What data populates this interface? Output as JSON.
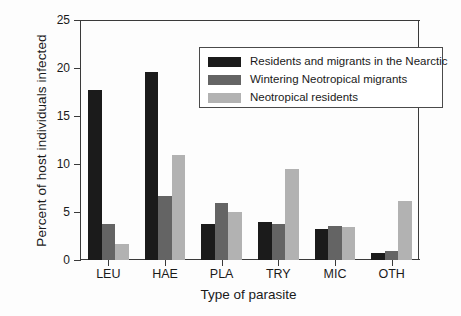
{
  "chart_data": {
    "type": "bar",
    "title": "",
    "xlabel": "Type of parasite",
    "ylabel": "Percent of host individuals infected",
    "categories": [
      "LEU",
      "HAE",
      "PLA",
      "TRY",
      "MIC",
      "OTH"
    ],
    "series": [
      {
        "name": "Residents and migrants in the Nearctic",
        "color": "#1b1b1b",
        "values": [
          17.7,
          19.6,
          3.8,
          4.0,
          3.2,
          0.7
        ]
      },
      {
        "name": "Wintering Neotropical migrants",
        "color": "#646464",
        "values": [
          3.8,
          6.7,
          5.9,
          3.7,
          3.5,
          0.9
        ]
      },
      {
        "name": "Neotropical residents",
        "color": "#b2b2b2",
        "values": [
          1.7,
          10.9,
          5.0,
          9.5,
          3.4,
          6.1
        ]
      }
    ],
    "ylim": [
      0,
      25
    ],
    "yticks": [
      0,
      5,
      10,
      15,
      20,
      25
    ],
    "ytick_labels": [
      "0",
      "5",
      "10",
      "15",
      "20",
      "25"
    ],
    "grid": false,
    "legend_position": "upper-right"
  },
  "legend": {
    "entries": [
      {
        "label": "Residents and migrants in the Nearctic"
      },
      {
        "label": "Wintering Neotropical migrants"
      },
      {
        "label": "Neotropical residents"
      }
    ]
  }
}
